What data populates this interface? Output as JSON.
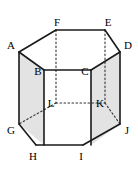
{
  "figure": {
    "type": "geometry-diagram",
    "shape_name": "hexagonal prism",
    "background_color": "#ffffff",
    "stroke_color": "#1a1a1a",
    "hidden_stroke_color": "#333333",
    "shaded_face_color": "#e3e3e3",
    "front_face_color": "#ffffff",
    "top_face_color": "#ffffff",
    "solid_stroke_width": 1.6,
    "hidden_stroke_width": 1.1,
    "hidden_dash_pattern": "1.6 2.4",
    "view_box": "0 0 138 171",
    "vertices": [
      {
        "id": "A",
        "label": "A",
        "x": 19,
        "y": 52,
        "label_x": 11,
        "label_y": 45,
        "hidden": false,
        "ring": "top"
      },
      {
        "id": "B",
        "label": "B",
        "x": 44,
        "y": 70,
        "label_x": 38,
        "label_y": 71,
        "hidden": false,
        "ring": "top"
      },
      {
        "id": "C",
        "label": "C",
        "x": 91,
        "y": 70,
        "label_x": 85,
        "label_y": 71,
        "hidden": false,
        "ring": "top"
      },
      {
        "id": "D",
        "label": "D",
        "x": 120,
        "y": 52,
        "label_x": 128,
        "label_y": 45,
        "hidden": false,
        "ring": "top"
      },
      {
        "id": "E",
        "label": "E",
        "x": 105,
        "y": 30,
        "label_x": 108,
        "label_y": 22,
        "hidden": false,
        "ring": "top"
      },
      {
        "id": "F",
        "label": "F",
        "x": 56,
        "y": 30,
        "label_x": 57,
        "label_y": 22,
        "hidden": false,
        "ring": "top"
      },
      {
        "id": "G",
        "label": "G",
        "x": 19,
        "y": 124,
        "label_x": 11,
        "label_y": 130,
        "hidden": false,
        "ring": "bottom"
      },
      {
        "id": "H",
        "label": "H",
        "x": 36,
        "y": 145,
        "label_x": 33,
        "label_y": 156,
        "hidden": false,
        "ring": "bottom"
      },
      {
        "id": "I",
        "label": "I",
        "x": 83,
        "y": 145,
        "label_x": 81,
        "label_y": 156,
        "hidden": false,
        "ring": "bottom"
      },
      {
        "id": "J",
        "label": "J",
        "x": 120,
        "y": 124,
        "label_x": 127,
        "label_y": 130,
        "hidden": false,
        "ring": "bottom"
      },
      {
        "id": "K",
        "label": "K",
        "x": 105,
        "y": 103,
        "label_x": 100,
        "label_y": 103,
        "hidden": true,
        "ring": "bottom"
      },
      {
        "id": "L",
        "label": "L",
        "x": 56,
        "y": 103,
        "label_x": 51,
        "label_y": 103,
        "hidden": true,
        "ring": "bottom"
      }
    ],
    "faces": [
      {
        "id": "left-face",
        "name": "face-ABHG",
        "path": "M 19 52 L 44 70 L 44 145 L 19 124 Z",
        "fill": "#e3e3e3"
      },
      {
        "id": "right-face",
        "name": "face-CDJI",
        "path": "M 91 70 L 120 52 L 120 124 L 91 145 Z",
        "fill": "#e3e3e3"
      },
      {
        "id": "front-face",
        "name": "face-BCIH",
        "path": "M 44 70 L 91 70 L 91 145 L 44 145 Z",
        "fill": "#ffffff"
      },
      {
        "id": "top-face",
        "name": "face-ABCDEF",
        "path": "M 19 52 L 56 30 L 105 30 L 120 52 L 91 70 L 44 70 Z",
        "fill": "#ffffff"
      }
    ],
    "solid_edges": [
      {
        "id": "edge-AF",
        "from": "A",
        "to": "F",
        "d": "M 19 52 L 56 30"
      },
      {
        "id": "edge-FE",
        "from": "F",
        "to": "E",
        "d": "M 56 30 L 105 30"
      },
      {
        "id": "edge-ED",
        "from": "E",
        "to": "D",
        "d": "M 105 30 L 120 52"
      },
      {
        "id": "edge-DC",
        "from": "D",
        "to": "C",
        "d": "M 120 52 L 91 70"
      },
      {
        "id": "edge-CB",
        "from": "C",
        "to": "B",
        "d": "M 91 70 L 44 70"
      },
      {
        "id": "edge-BA",
        "from": "B",
        "to": "A",
        "d": "M 44 70 L 19 52"
      },
      {
        "id": "edge-AG",
        "from": "A",
        "to": "G",
        "d": "M 19 52 L 19 124"
      },
      {
        "id": "edge-BH",
        "from": "B",
        "to": "H",
        "d": "M 44 70 L 44 145"
      },
      {
        "id": "edge-CI",
        "from": "C",
        "to": "I",
        "d": "M 91 70 L 91 145"
      },
      {
        "id": "edge-DJ",
        "from": "D",
        "to": "J",
        "d": "M 120 52 L 120 124"
      },
      {
        "id": "edge-GH",
        "from": "G",
        "to": "H",
        "d": "M 19 124 L 36 145"
      },
      {
        "id": "edge-HI",
        "from": "H",
        "to": "I",
        "d": "M 36 145 L 83 145"
      },
      {
        "id": "edge-IJ",
        "from": "I",
        "to": "J",
        "d": "M 83 145 L 120 124"
      }
    ],
    "hidden_edges": [
      {
        "id": "edge-FL",
        "from": "F",
        "to": "L",
        "d": "M 56 30 L 56 103"
      },
      {
        "id": "edge-EK",
        "from": "E",
        "to": "K",
        "d": "M 105 30 L 105 103"
      },
      {
        "id": "edge-LK",
        "from": "L",
        "to": "K",
        "d": "M 56 103 L 105 103"
      },
      {
        "id": "edge-LG",
        "from": "L",
        "to": "G",
        "d": "M 56 103 L 19 124"
      },
      {
        "id": "edge-KJ",
        "from": "K",
        "to": "J",
        "d": "M 105 103 L 120 124"
      }
    ]
  }
}
